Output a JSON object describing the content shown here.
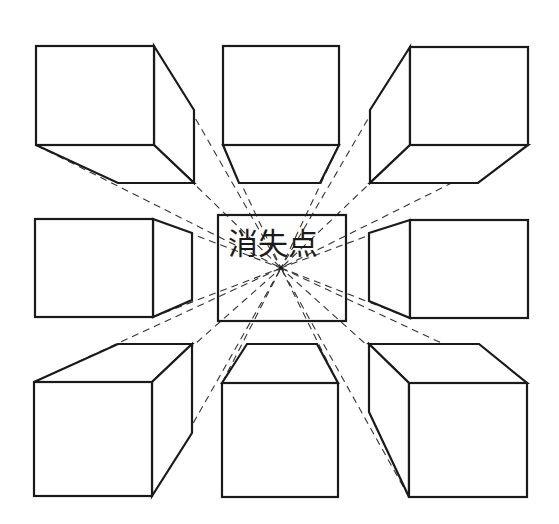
{
  "diagram": {
    "type": "one-point-perspective",
    "label": "消失点",
    "vanishing_point": [
      281,
      268
    ],
    "colors": {
      "line": "#1a1a1a",
      "dash": "#333333",
      "background": "#ffffff"
    },
    "center_box": {
      "x": 218,
      "y": 215,
      "w": 128,
      "h": 106
    },
    "cubes": [
      {
        "id": "top-left",
        "front": [
          36,
          46,
          118,
          99
        ]
      },
      {
        "id": "top-middle",
        "front": [
          223,
          46,
          116,
          99
        ]
      },
      {
        "id": "top-right",
        "front": [
          410,
          47,
          118,
          98
        ]
      },
      {
        "id": "middle-left",
        "front": [
          35,
          219,
          118,
          98
        ]
      },
      {
        "id": "middle-right",
        "front": [
          410,
          220,
          118,
          98
        ]
      },
      {
        "id": "bottom-left",
        "front": [
          34,
          382,
          118,
          114
        ]
      },
      {
        "id": "bottom-middle",
        "front": [
          222,
          383,
          116,
          114
        ]
      },
      {
        "id": "bottom-right",
        "front": [
          409,
          383,
          118,
          114
        ]
      }
    ]
  }
}
